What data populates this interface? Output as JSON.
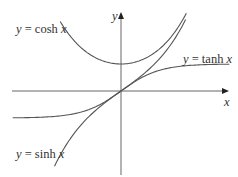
{
  "chart_data": {
    "type": "line",
    "title": "",
    "xlabel": "x",
    "ylabel": "y",
    "grid": false,
    "legend": "inline labels",
    "xlim": [
      -2.8,
      2.8
    ],
    "ylim": [
      -3.1,
      2.85
    ],
    "series": [
      {
        "name": "y = cosh x",
        "function": "cosh",
        "x": [
          -1.6,
          -1.2,
          -0.8,
          -0.4,
          0,
          0.4,
          0.8,
          1.2,
          1.6
        ],
        "y": [
          2.58,
          1.81,
          1.34,
          1.08,
          1.0,
          1.08,
          1.34,
          1.81,
          2.58
        ]
      },
      {
        "name": "y = tanh x",
        "function": "tanh",
        "x": [
          -2.8,
          -2,
          -1,
          -0.5,
          0,
          0.5,
          1,
          2,
          2.8
        ],
        "y": [
          -0.99,
          -0.96,
          -0.76,
          -0.46,
          0,
          0.46,
          0.76,
          0.96,
          0.99
        ]
      },
      {
        "name": "y = sinh x",
        "function": "sinh",
        "x": [
          -1.8,
          -1.2,
          -0.8,
          -0.4,
          0,
          0.4,
          0.8,
          1.2,
          1.65
        ],
        "y": [
          -2.94,
          -1.51,
          -0.89,
          -0.41,
          0,
          0.41,
          0.89,
          1.51,
          2.5
        ]
      }
    ],
    "annotations": [
      "y = cosh x",
      "y = tanh x",
      "y = sinh x"
    ]
  },
  "labels": {
    "cosh": {
      "pre": "y",
      "mid": " = cosh ",
      "var": "x"
    },
    "tanh": {
      "pre": "y",
      "mid": " = tanh ",
      "var": "x"
    },
    "sinh": {
      "pre": "y",
      "mid": " = sinh ",
      "var": "x"
    },
    "x_axis": "x",
    "y_axis": "y"
  },
  "colors": {
    "curve": "#555555",
    "axis": "#666666",
    "text": "#333333"
  }
}
